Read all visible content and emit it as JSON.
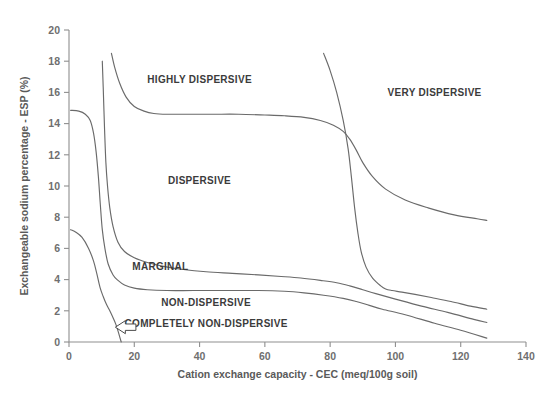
{
  "figure": {
    "background": "#ffffff",
    "line_color": "#6a6a6a",
    "axis_color": "#8f8f8f",
    "text_color": "#3b3b3b"
  },
  "chart_data": {
    "type": "line",
    "title": "",
    "subtitle": "",
    "xlabel": "Cation exchange capacity  -  CEC  (meq/100g soil)",
    "ylabel": "Exchangeable sodium percentage - ESP (%)",
    "xlim": [
      0,
      140
    ],
    "ylim": [
      0,
      20
    ],
    "xticks": [
      0,
      20,
      40,
      60,
      80,
      100,
      120,
      140
    ],
    "yticks": [
      0,
      2,
      4,
      6,
      8,
      10,
      12,
      14,
      16,
      18,
      20
    ],
    "grid": false,
    "legend": "none",
    "annotations": [
      {
        "text": "HIGHLY DISPERSIVE",
        "x": 40,
        "y": 16.6
      },
      {
        "text": "VERY DISPERSIVE",
        "x": 112,
        "y": 15.8
      },
      {
        "text": "DISPERSIVE",
        "x": 40,
        "y": 10.1
      },
      {
        "text": "MARGINAL",
        "x": 28,
        "y": 4.6
      },
      {
        "text": "NON-DISPERSIVE",
        "x": 42,
        "y": 2.3
      },
      {
        "text": "COMPLETELY NON-DISPERSIVE",
        "x": 42,
        "y": 0.95,
        "arrow": "left-arrow-icon"
      }
    ],
    "series": [
      {
        "name": "completely-non-dispersive-boundary",
        "comment": "leftmost curve: ESP 7.2 at CEC 0 falling to ESP 0 at CEC 16",
        "x": [
          0.5,
          2,
          4,
          6,
          7.5,
          8.5,
          9.5,
          10.5,
          11.5,
          12.5,
          13.5,
          14.5,
          15.3,
          16.0
        ],
        "y": [
          7.2,
          7.05,
          6.7,
          6.0,
          5.2,
          4.4,
          3.5,
          2.9,
          2.4,
          2.0,
          1.55,
          1.05,
          0.5,
          0.0
        ]
      },
      {
        "name": "non-dispersive-marginal-boundary",
        "comment": "starts ESP 14.85 at CEC 0, drops near CEC 10, runs ~3.2 then falls to 0.25 at CEC 128",
        "x": [
          0.5,
          3,
          5,
          6.5,
          7.5,
          8.3,
          9.0,
          9.6,
          10.2,
          11,
          12,
          13.5,
          15,
          17,
          20,
          24,
          30,
          38,
          48,
          58,
          66,
          72,
          78,
          84,
          88,
          92,
          96,
          103,
          112,
          120,
          128
        ],
        "y": [
          14.85,
          14.8,
          14.6,
          14.2,
          13.4,
          12.2,
          10.6,
          8.8,
          7.2,
          6.0,
          5.0,
          4.3,
          3.95,
          3.65,
          3.45,
          3.35,
          3.3,
          3.3,
          3.3,
          3.3,
          3.25,
          3.15,
          3.0,
          2.8,
          2.6,
          2.35,
          2.1,
          1.75,
          1.2,
          0.75,
          0.25
        ]
      },
      {
        "name": "marginal-dispersive-boundary",
        "comment": "near-vertical at CEC ~10-11 from ESP 18 down, levels ~4.6 then falls to 1.25 at CEC 128",
        "x": [
          10.2,
          10.5,
          10.9,
          11.3,
          11.8,
          12.5,
          13.5,
          15,
          17,
          20,
          24,
          29,
          35,
          42,
          50,
          58,
          65,
          71,
          77,
          82,
          86,
          90,
          94,
          100,
          108,
          116,
          124,
          128
        ],
        "y": [
          18.0,
          16.2,
          13.6,
          11.5,
          10.0,
          8.6,
          7.4,
          6.4,
          5.8,
          5.4,
          5.1,
          4.85,
          4.65,
          4.5,
          4.4,
          4.3,
          4.2,
          4.1,
          3.95,
          3.8,
          3.6,
          3.35,
          3.1,
          2.75,
          2.3,
          1.9,
          1.45,
          1.25
        ]
      },
      {
        "name": "dispersive-highly-dispersive-boundary",
        "comment": "starts ESP 18.5 at CEC 13, levels ~14.6, falls steeply near CEC 88 to 7.8 at CEC 128",
        "x": [
          13.0,
          14.0,
          15.5,
          17.5,
          20,
          23,
          26,
          30,
          36,
          44,
          52,
          60,
          66,
          72,
          77,
          81,
          84,
          86,
          88,
          90,
          93,
          97,
          103,
          110,
          118,
          125,
          128
        ],
        "y": [
          18.5,
          17.6,
          16.6,
          15.7,
          15.1,
          14.8,
          14.65,
          14.6,
          14.6,
          14.6,
          14.6,
          14.55,
          14.5,
          14.4,
          14.2,
          13.9,
          13.5,
          13.0,
          12.3,
          11.5,
          10.6,
          9.8,
          9.1,
          8.6,
          8.15,
          7.9,
          7.8
        ]
      },
      {
        "name": "highly-dispersive-very-dispersive-boundary",
        "comment": "steep curve from ESP 18.5 at CEC 78 falling, level ~3.5 then to 2.1 at CEC 128",
        "x": [
          78,
          80,
          82,
          84,
          85.5,
          86.5,
          87.5,
          88.5,
          89.5,
          91,
          93,
          95.5,
          97,
          99,
          102,
          106,
          111,
          117,
          123,
          128
        ],
        "y": [
          18.5,
          17.4,
          16.0,
          14.2,
          12.4,
          10.6,
          8.6,
          7.0,
          5.8,
          4.8,
          4.1,
          3.6,
          3.4,
          3.3,
          3.2,
          3.05,
          2.85,
          2.6,
          2.3,
          2.1
        ]
      }
    ]
  }
}
